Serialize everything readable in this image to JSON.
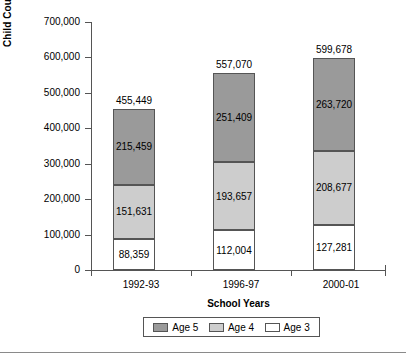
{
  "chart_data": {
    "type": "bar",
    "subtype": "stacked-vertical",
    "title": "",
    "xlabel": "School Years",
    "ylabel": "Child Count by Age",
    "categories": [
      "1992-93",
      "1996-97",
      "2000-01"
    ],
    "series": [
      {
        "name": "Age 3",
        "values": [
          88359,
          112004,
          127281
        ],
        "color": "#ffffff",
        "labels": [
          "88,359",
          "112,004",
          "127,281"
        ]
      },
      {
        "name": "Age 4",
        "values": [
          151631,
          193657,
          208677
        ],
        "color": "#cdcdcd",
        "labels": [
          "151,631",
          "193,657",
          "208,677"
        ]
      },
      {
        "name": "Age 5",
        "values": [
          215459,
          251409,
          263720
        ],
        "color": "#9a9a9a",
        "labels": [
          "215,459",
          "251,409",
          "263,720"
        ]
      }
    ],
    "totals": [
      455449,
      557070,
      599678
    ],
    "total_labels": [
      "455,449",
      "557,070",
      "599,678"
    ],
    "ylim": [
      0,
      700000
    ],
    "ytick_labels": [
      "700,000",
      "600,000",
      "500,000",
      "400,000",
      "300,000",
      "200,000",
      "100,000",
      "0"
    ],
    "ytick_values": [
      700000,
      600000,
      500000,
      400000,
      300000,
      200000,
      100000,
      0
    ],
    "grid": false,
    "legend_position": "bottom",
    "legend_order": [
      "Age 5",
      "Age 4",
      "Age 3"
    ]
  },
  "axes": {
    "y_title": "Child Count by Age",
    "x_title": "School Years"
  },
  "legend": {
    "items": [
      {
        "label": "Age 5",
        "color": "#9a9a9a"
      },
      {
        "label": "Age 4",
        "color": "#cdcdcd"
      },
      {
        "label": "Age 3",
        "color": "#ffffff"
      }
    ]
  }
}
